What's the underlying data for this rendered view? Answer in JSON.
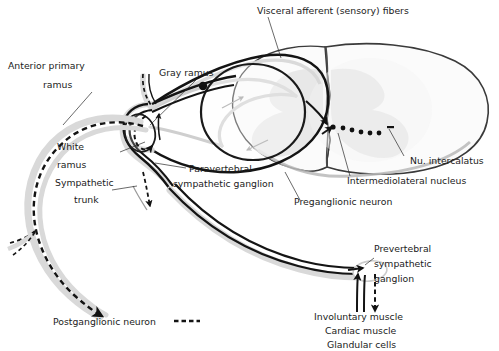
{
  "figure": {
    "type": "anatomical-diagram",
    "background": "#ffffff",
    "ink": "#1b1b1b",
    "gray_fill": "#e9e9e9",
    "gray_arrow": "#9a9a9a",
    "halo": "#d8d8d8"
  },
  "labels": {
    "visceral_afferent": "Visceral afferent (sensory) fibers",
    "gray_ramus": "Gray ramus",
    "anterior_primary_ramus_line1": "Anterior primary",
    "anterior_primary_ramus_line2": "ramus",
    "white_ramus_line1": "White",
    "white_ramus_line2": "ramus",
    "sympathetic_trunk_line1": "Sympathetic",
    "sympathetic_trunk_line2": "trunk",
    "paravertebral_line1": "Paravertebral",
    "paravertebral_line2": "sympathetic ganglion",
    "nu_intercalatus": "Nu. intercalatus",
    "intermediolateral_nucleus": "Intermediolateral nucleus",
    "preganglionic_neuron": "Preganglionic neuron",
    "prevertebral_line1": "Prevertebral",
    "prevertebral_line2": "sympathetic",
    "prevertebral_line3": "ganglion",
    "postganglionic_neuron": "Postganglionic neuron",
    "target_line1": "Involuntary muscle",
    "target_line2": "Cardiac muscle",
    "target_line3": "Glandular cells"
  },
  "legend": {
    "postganglionic_dash_key": "- - - -"
  }
}
